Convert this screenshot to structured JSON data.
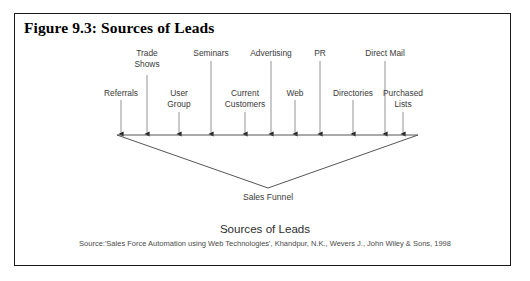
{
  "figure": {
    "title": "Figure 9.3: Sources of Leads",
    "border_color": "#1a1a1a",
    "background": "#ffffff"
  },
  "diagram": {
    "type": "funnel",
    "line_color": "#555555",
    "arrow_color": "#222222",
    "funnel_bar": {
      "x1": 117,
      "x2": 418,
      "y": 135
    },
    "funnel_apex": {
      "x": 268,
      "y": 188
    },
    "funnel_caption": "Sales Funnel",
    "sources": [
      {
        "label": "Referrals",
        "row": "lower",
        "x": 121,
        "label_y": 88,
        "line_top": 100
      },
      {
        "label": "Trade\nShows",
        "row": "upper",
        "x": 147,
        "label_y": 48,
        "line_top": 75
      },
      {
        "label": "User\nGroup",
        "row": "lower",
        "x": 179,
        "label_y": 88,
        "line_top": 112
      },
      {
        "label": "Seminars",
        "row": "upper",
        "x": 211,
        "label_y": 48,
        "line_top": 61
      },
      {
        "label": "Current\nCustomers",
        "row": "lower",
        "x": 245,
        "label_y": 88,
        "line_top": 112
      },
      {
        "label": "Advertising",
        "row": "upper",
        "x": 271,
        "label_y": 48,
        "line_top": 61
      },
      {
        "label": "Web",
        "row": "lower",
        "x": 295,
        "label_y": 88,
        "line_top": 100
      },
      {
        "label": "PR",
        "row": "upper",
        "x": 320,
        "label_y": 48,
        "line_top": 61
      },
      {
        "label": "Directories",
        "row": "lower",
        "x": 353,
        "label_y": 88,
        "line_top": 100
      },
      {
        "label": "Direct Mail",
        "row": "upper",
        "x": 385,
        "label_y": 48,
        "line_top": 61
      },
      {
        "label": "Purchased\nLists",
        "row": "lower",
        "x": 403,
        "label_y": 88,
        "line_top": 112
      }
    ]
  },
  "caption": {
    "title": "Sources of Leads",
    "source": "Source:'Sales Force Automation using Web Technologies', Khandpur, N.K., Wevers J., John Wiley & Sons, 1998"
  }
}
